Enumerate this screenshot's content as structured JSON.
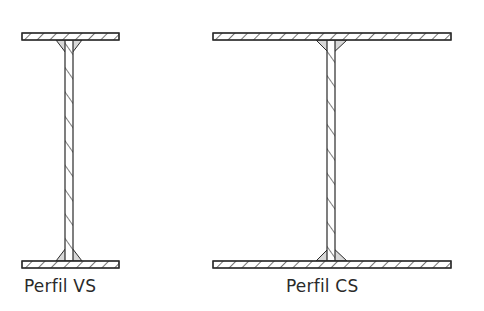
{
  "figure": {
    "type": "structural cross-section diagram",
    "colors": {
      "stroke": "#2a2a2a",
      "fill": "#ffffff",
      "weld_fill": "#d8d8d8",
      "background": "#ffffff"
    }
  },
  "profiles": [
    {
      "id": "vs",
      "label": "Perfil VS",
      "top_flange": {
        "x": 22,
        "y": 33,
        "w": 97,
        "h": 7
      },
      "bottom_flange": {
        "x": 22,
        "y": 261,
        "w": 97,
        "h": 7
      },
      "web": {
        "x": 65,
        "w": 8
      },
      "weld": {
        "left": 56,
        "right": 82,
        "depth": 17
      }
    },
    {
      "id": "cs",
      "label": "Perfil CS",
      "top_flange": {
        "x": 213,
        "y": 33,
        "w": 238,
        "h": 7
      },
      "bottom_flange": {
        "x": 213,
        "y": 261,
        "w": 238,
        "h": 7
      },
      "web": {
        "x": 327,
        "w": 8
      },
      "weld": {
        "left": 316,
        "right": 347,
        "depth": 15
      }
    }
  ]
}
